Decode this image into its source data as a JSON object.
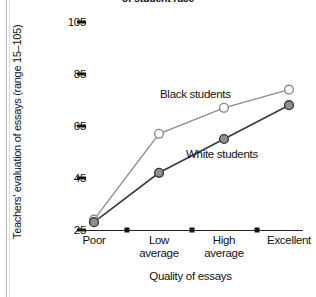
{
  "chart_data": {
    "type": "line",
    "title": "of student race",
    "xlabel": "Quality of essays",
    "ylabel": "Teachers' evaluation of essays (range 15–105)",
    "categories": [
      "Poor",
      "Low average",
      "High average",
      "Excellent"
    ],
    "category_lines": [
      [
        "Poor"
      ],
      [
        "Low",
        "average"
      ],
      [
        "High",
        "average"
      ],
      [
        "Excellent"
      ]
    ],
    "yticks": [
      25,
      45,
      65,
      85,
      105
    ],
    "ylim": [
      25,
      105
    ],
    "grid": false,
    "legend_position": "inline-annotation",
    "series": [
      {
        "name": "Black students",
        "values": [
          29,
          62,
          72,
          79
        ],
        "marker": "open-circle",
        "color": "#8c8c8c",
        "fill": "#ffffff"
      },
      {
        "name": "White students",
        "values": [
          28,
          47,
          60,
          73
        ],
        "marker": "filled-circle",
        "color": "#3a3a3a",
        "fill": "#8f8f8f"
      }
    ]
  },
  "colors": {
    "axis": "#222222",
    "text": "#111111",
    "black_series": "#8c8c8c",
    "white_series": "#3a3a3a",
    "marker_fill_gray": "#8f8f8f"
  }
}
